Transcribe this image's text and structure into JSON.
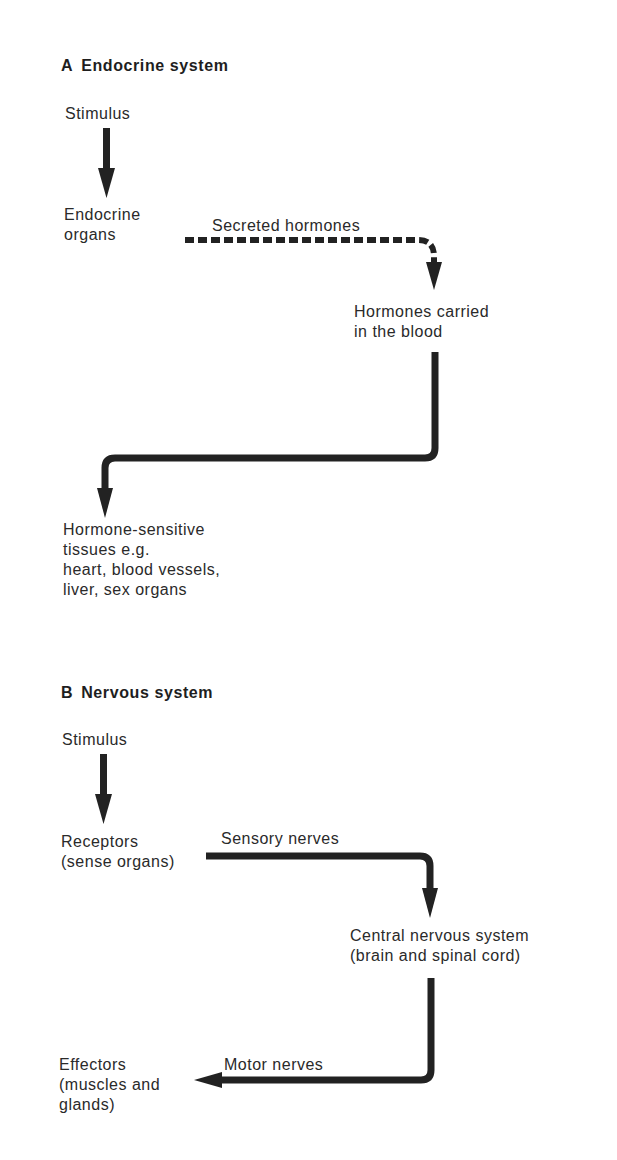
{
  "section_a": {
    "letter": "A",
    "title": "Endocrine system",
    "stimulus": "Stimulus",
    "organs": [
      "Endocrine",
      "organs"
    ],
    "secreted_label": "Secreted hormones",
    "carried": [
      "Hormones carried",
      "in the blood"
    ],
    "target": [
      "Hormone-sensitive",
      "tissues e.g.",
      "heart, blood vessels,",
      "liver, sex organs"
    ]
  },
  "section_b": {
    "letter": "B",
    "title": "Nervous system",
    "stimulus": "Stimulus",
    "receptors": [
      "Receptors",
      "(sense organs)"
    ],
    "sensory_label": "Sensory nerves",
    "cns": [
      "Central nervous system",
      "(brain and spinal cord)"
    ],
    "motor_label": "Motor nerves",
    "effectors": [
      "Effectors",
      "(muscles and",
      "glands)"
    ]
  },
  "colors": {
    "ink": "#2a2a2a",
    "background": "#ffffff"
  }
}
